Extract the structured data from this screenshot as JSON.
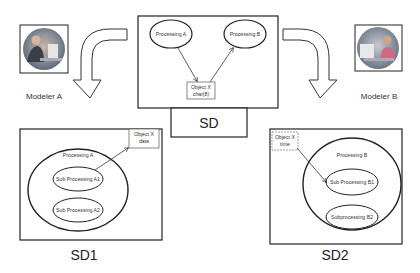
{
  "modelers": {
    "a": {
      "label": "Modeler A"
    },
    "b": {
      "label": "Modeler B"
    }
  },
  "sd": {
    "title": "SD",
    "processes": [
      "Processing A",
      "Processing B"
    ],
    "object": {
      "line1": "Object X",
      "line2": "char(8)"
    }
  },
  "sd1": {
    "title": "SD1",
    "process": "Processing A",
    "subprocesses": [
      "Sub Processing A1",
      "Sub Processing A2"
    ],
    "object": {
      "line1": "Object X",
      "line2": "date"
    }
  },
  "sd2": {
    "title": "SD2",
    "process": "Processing B",
    "subprocesses": [
      "Sub Processing B1",
      "Subprocessing B2"
    ],
    "object": {
      "line1": "Object X",
      "line2": "time"
    }
  },
  "colors": {
    "line": "#222222",
    "text": "#333333",
    "photo_bg": "#8a9aa8"
  }
}
